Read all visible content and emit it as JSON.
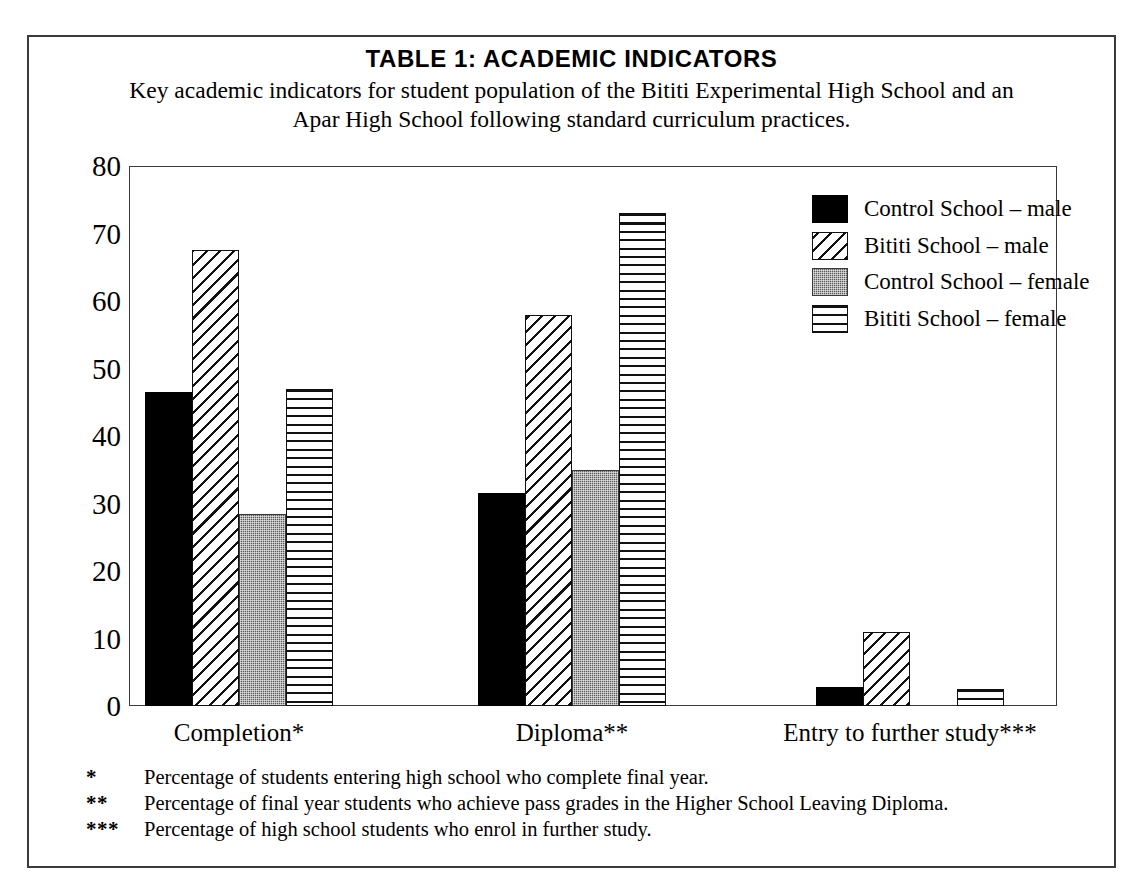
{
  "chart_data": {
    "type": "bar",
    "title": "TABLE 1:   ACADEMIC INDICATORS",
    "subtitle": "Key academic indicators for student population of the Bititi Experimental High School and an Apar High School following standard curriculum practices.",
    "xlabel": "",
    "ylabel": "",
    "ylim": [
      0,
      80
    ],
    "yticks": [
      80,
      70,
      60,
      50,
      40,
      30,
      20,
      10,
      0
    ],
    "grid": false,
    "legend_position": "top-right",
    "categories": [
      "Completion*",
      "Diploma**",
      "Entry to further study***"
    ],
    "series": [
      {
        "name": "Control School – male",
        "fill": "solid-black",
        "values": [
          46.5,
          31.5,
          2.8
        ]
      },
      {
        "name": "Bititi School – male",
        "fill": "diagonal-hatch",
        "values": [
          67.5,
          58.0,
          11.0
        ]
      },
      {
        "name": "Control School – female",
        "fill": "gray-stipple",
        "values": [
          28.5,
          35.0,
          0
        ]
      },
      {
        "name": "Bititi School – female",
        "fill": "horizontal-lines",
        "values": [
          47.0,
          73.0,
          2.5
        ]
      }
    ]
  },
  "legend": {
    "items": [
      {
        "label": "Control School – male"
      },
      {
        "label": "Bititi School – male"
      },
      {
        "label": "Control School – female"
      },
      {
        "label": "Bititi School – female"
      }
    ]
  },
  "footnotes": [
    {
      "mark": "*",
      "text": "Percentage of students entering high school who complete final year."
    },
    {
      "mark": "**",
      "text": "Percentage of final year students who achieve pass grades in the Higher School Leaving Diploma."
    },
    {
      "mark": "***",
      "text": "Percentage of high school students who enrol in further study."
    }
  ]
}
